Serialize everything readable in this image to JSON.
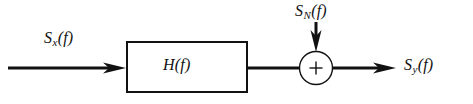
{
  "figure": {
    "kind": "signal-flow-block-diagram",
    "background_color": "#ffffff",
    "stroke_color": "#111111"
  },
  "labels": {
    "input": {
      "name": "S_x(f)",
      "base": "S",
      "subscript": "x",
      "argument": "(f)"
    },
    "noise": {
      "name": "S_N(f)",
      "base": "S",
      "subscript": "N",
      "argument": "(f)"
    },
    "output": {
      "name": "S_y(f)",
      "base": "S",
      "subscript": "y",
      "argument": "(f)"
    },
    "block": {
      "name": "H(f)",
      "base": "H",
      "subscript": "",
      "argument": "(f)"
    },
    "summer_operator": "+"
  },
  "nodes": {
    "filter_block": {
      "label": "H(f)",
      "x": 127,
      "y": 42,
      "width": 120,
      "height": 50,
      "stroke_width": 2
    },
    "summing_junction": {
      "label": "+",
      "center_x": 316,
      "center_y": 68,
      "radius": 16.5,
      "stroke_width": 1.4
    }
  },
  "edges": [
    {
      "name": "input-signal-arrow",
      "from": "source",
      "to": "filter-block",
      "x1": 8,
      "y1": 68,
      "x2": 126,
      "y2": 68,
      "arrowhead": true,
      "stroke_width": 3
    },
    {
      "name": "filter-to-summer-line",
      "from": "filter-block",
      "to": "summing-junction",
      "x1": 247,
      "y1": 68,
      "x2": 300,
      "y2": 68,
      "arrowhead": false,
      "stroke_width": 3
    },
    {
      "name": "noise-injection-arrow",
      "from": "noise-source",
      "to": "summing-junction",
      "x1": 316,
      "y1": 22,
      "x2": 316,
      "y2": 51,
      "arrowhead": true,
      "stroke_width": 3
    },
    {
      "name": "output-signal-arrow",
      "from": "summing-junction",
      "to": "sink",
      "x1": 333,
      "y1": 68,
      "x2": 396,
      "y2": 68,
      "arrowhead": true,
      "stroke_width": 3
    }
  ]
}
